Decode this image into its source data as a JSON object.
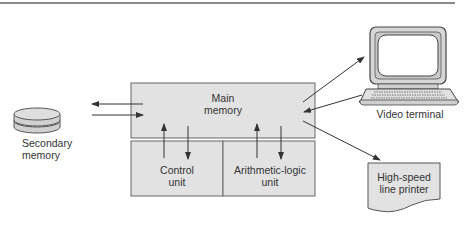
{
  "diagram": {
    "nodes": {
      "main_memory": {
        "label_line1": "Main",
        "label_line2": "memory"
      },
      "control_unit": {
        "label_line1": "Control",
        "label_line2": "unit"
      },
      "alu": {
        "label_line1": "Arithmetic-logic",
        "label_line2": "unit"
      },
      "secondary_memory": {
        "label_line1": "Secondary",
        "label_line2": "memory"
      },
      "video_terminal": {
        "label": "Video terminal"
      },
      "printer": {
        "label_line1": "High-speed",
        "label_line2": "line printer"
      }
    },
    "edges": [
      {
        "from": "main_memory",
        "to": "secondary_memory"
      },
      {
        "from": "secondary_memory",
        "to": "main_memory"
      },
      {
        "from": "control_unit",
        "to": "main_memory"
      },
      {
        "from": "main_memory",
        "to": "control_unit"
      },
      {
        "from": "alu",
        "to": "main_memory"
      },
      {
        "from": "main_memory",
        "to": "alu"
      },
      {
        "from": "main_memory",
        "to": "video_terminal"
      },
      {
        "from": "video_terminal",
        "to": "main_memory"
      },
      {
        "from": "main_memory",
        "to": "printer"
      }
    ],
    "colors": {
      "box_fill": "#e2e2e2",
      "stroke": "#555555",
      "line": "#444444"
    }
  }
}
